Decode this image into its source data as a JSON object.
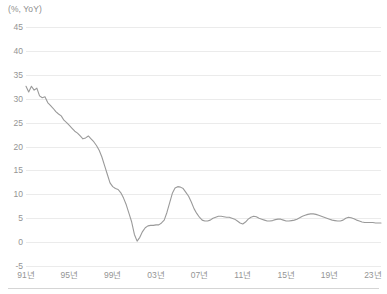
{
  "axis_unit_label": "(%, YoY)",
  "colors": {
    "line": "#9a9a9a",
    "grid": "#ebebeb",
    "tick_text": "#949494",
    "unit_text": "#8d8d8d",
    "background": "#ffffff",
    "bottom_rule": "#d5d5d5"
  },
  "chart_data": {
    "type": "line",
    "title": "",
    "subtitle": "",
    "xlabel": "",
    "ylabel": "(%, YoY)",
    "ylim": [
      -5,
      45
    ],
    "xlim": [
      1991,
      2023.75
    ],
    "grid": true,
    "legend": false,
    "legend_position": "none",
    "ytick_labels": [
      "45",
      "40",
      "35",
      "30",
      "25",
      "20",
      "15",
      "10",
      "5",
      "0",
      "-5"
    ],
    "yticks": [
      45,
      40,
      35,
      30,
      25,
      20,
      15,
      10,
      5,
      0,
      -5
    ],
    "xtick_labels": [
      "91년",
      "95년",
      "99년",
      "03년",
      "07년",
      "11년",
      "15년",
      "19년",
      "23년"
    ],
    "xticks": [
      1991,
      1995,
      1999,
      2003,
      2007,
      2011,
      2015,
      2019,
      2023
    ],
    "series": [
      {
        "name": "",
        "color": "#9a9a9a",
        "x": [
          1991.0,
          1991.25,
          1991.5,
          1991.75,
          1992.0,
          1992.25,
          1992.5,
          1992.75,
          1993.0,
          1993.25,
          1993.5,
          1993.75,
          1994.0,
          1994.25,
          1994.5,
          1994.75,
          1995.0,
          1995.25,
          1995.5,
          1995.75,
          1996.0,
          1996.25,
          1996.5,
          1996.75,
          1997.0,
          1997.25,
          1997.5,
          1997.75,
          1998.0,
          1998.25,
          1998.5,
          1998.75,
          1999.0,
          1999.25,
          1999.5,
          1999.75,
          2000.0,
          2000.25,
          2000.5,
          2000.75,
          2001.0,
          2001.25,
          2001.5,
          2001.75,
          2002.0,
          2002.25,
          2002.5,
          2002.75,
          2003.0,
          2003.25,
          2003.5,
          2003.75,
          2004.0,
          2004.25,
          2004.5,
          2004.75,
          2005.0,
          2005.25,
          2005.5,
          2005.75,
          2006.0,
          2006.25,
          2006.5,
          2006.75,
          2007.0,
          2007.25,
          2007.5,
          2007.75,
          2008.0,
          2008.25,
          2008.5,
          2008.75,
          2009.0,
          2009.25,
          2009.5,
          2009.75,
          2010.0,
          2010.25,
          2010.5,
          2010.75,
          2011.0,
          2011.25,
          2011.5,
          2011.75,
          2012.0,
          2012.25,
          2012.5,
          2012.75,
          2013.0,
          2013.25,
          2013.5,
          2013.75,
          2014.0,
          2014.25,
          2014.5,
          2014.75,
          2015.0,
          2015.25,
          2015.5,
          2015.75,
          2016.0,
          2016.25,
          2016.5,
          2016.75,
          2017.0,
          2017.25,
          2017.5,
          2017.75,
          2018.0,
          2018.25,
          2018.5,
          2018.75,
          2019.0,
          2019.25,
          2019.5,
          2019.75,
          2020.0,
          2020.25,
          2020.5,
          2020.75,
          2021.0,
          2021.25,
          2021.5,
          2021.75,
          2022.0,
          2022.25,
          2022.5,
          2022.75,
          2023.0,
          2023.25,
          2023.5,
          2023.75
        ],
        "y": [
          32.6,
          31.4,
          32.6,
          31.8,
          32.2,
          30.6,
          30.2,
          30.4,
          29.2,
          28.6,
          28.0,
          27.3,
          26.8,
          26.4,
          25.5,
          25.0,
          24.4,
          23.8,
          23.2,
          22.8,
          22.2,
          21.6,
          21.8,
          22.2,
          21.6,
          21.0,
          20.2,
          19.2,
          17.8,
          16.0,
          14.2,
          12.4,
          11.6,
          11.2,
          11.0,
          10.3,
          9.2,
          7.8,
          6.0,
          4.2,
          1.6,
          0.2,
          1.0,
          2.2,
          3.0,
          3.4,
          3.5,
          3.5,
          3.6,
          3.6,
          4.0,
          4.6,
          6.2,
          8.2,
          10.2,
          11.3,
          11.6,
          11.5,
          11.2,
          10.4,
          9.6,
          8.4,
          7.0,
          6.0,
          5.2,
          4.6,
          4.4,
          4.4,
          4.6,
          5.0,
          5.2,
          5.4,
          5.4,
          5.3,
          5.2,
          5.2,
          5.0,
          4.8,
          4.4,
          4.0,
          3.8,
          4.2,
          4.8,
          5.2,
          5.4,
          5.3,
          5.0,
          4.8,
          4.6,
          4.4,
          4.4,
          4.5,
          4.7,
          4.8,
          4.8,
          4.6,
          4.4,
          4.4,
          4.5,
          4.6,
          4.8,
          5.1,
          5.4,
          5.6,
          5.8,
          5.9,
          5.9,
          5.8,
          5.6,
          5.4,
          5.2,
          5.0,
          4.8,
          4.6,
          4.5,
          4.4,
          4.4,
          4.6,
          5.0,
          5.2,
          5.1,
          4.9,
          4.6,
          4.4,
          4.2,
          4.1,
          4.1,
          4.1,
          4.1,
          4.0,
          4.0,
          4.0
        ]
      }
    ]
  }
}
